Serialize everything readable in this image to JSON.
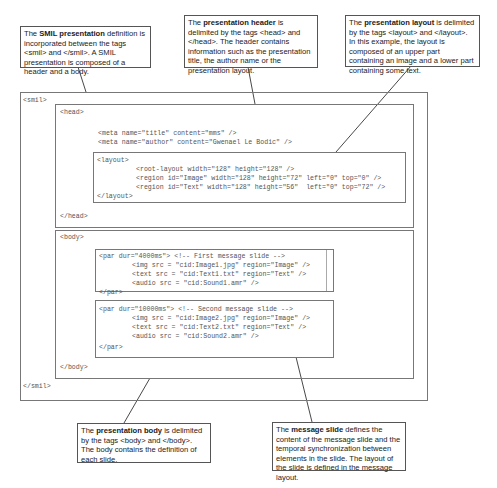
{
  "callouts": {
    "smil": {
      "pre": "The ",
      "bold": "SMIL presentation",
      "post": " definition is incorporated between the tags <smil> and </smil>. A SMIL presentation is composed of a header and a body."
    },
    "header": {
      "pre": "The ",
      "bold": "presentation header",
      "post": " is delimited by the tags <head> and </head>. The header contains information such as the presentation title, the author name or the presentation layout."
    },
    "layout": {
      "pre": "The ",
      "bold": "presentation layout",
      "post": " is delimited by the tags <layout> and </layout>. In this example, the layout is composed of an upper part containing an image and a lower part containing some text."
    },
    "body": {
      "pre": "The ",
      "bold": "presentation body",
      "post": " is delimited by the tags <body> and </body>. The body contains the definition of each slide."
    },
    "slide": {
      "pre": "The ",
      "bold": "message slide",
      "post": " defines the content of the message slide and the temporal synchronization between elements in the slide. The layout of the slide is defined in the message layout."
    }
  },
  "code": {
    "smil_open": "<smil>",
    "smil_close": "</smil>",
    "head_open": "<head>",
    "head_close": "</head>",
    "meta_lines": [
      "<meta name=\"title\" content=\"mms\" />",
      "<meta name=\"author\" content=\"Gwenael Le Bodic\" />"
    ],
    "layout_open": "<layout>",
    "layout_close": "</layout>",
    "layout_lines": [
      "<root-layout width=\"128\" height=\"128\" />",
      "<region id=\"Image\" width=\"128\" height=\"72\" left=\"0\" top=\"0\" />",
      "<region id=\"Text\" width=\"128\" height=\"56\"  left=\"0\" top=\"72\" />"
    ],
    "body_open": "<body>",
    "body_close": "</body>",
    "par1_open": "<par dur=\"4000ms\"> <!-- First message slide -->",
    "par1_lines": [
      "<img src = \"cid:Image1.jpg\" region=\"Image\" />",
      "<text src = \"cid:Text1.txt\" region=\"Text\" />",
      "<audio src = \"cid:Sound1.amr\" />"
    ],
    "par2_open": "<par dur=\"10000ms\"> <!-- Second message slide -->",
    "par2_lines": [
      "<img src = \"cid:Image2.jpg\" region=\"Image\" />",
      "<text src = \"cid:Text2.txt\" region=\"Text\" />",
      "<audio src = \"cid:Sound2.amr\" />"
    ],
    "par_close": "</par>"
  },
  "colors": {
    "frame": "#777777",
    "callout_border": "#555555",
    "code_text": "#555555",
    "connector": "#333333"
  }
}
